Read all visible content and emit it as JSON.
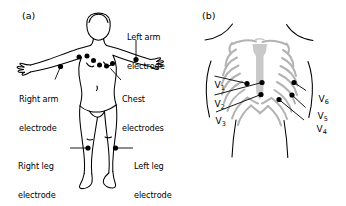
{
  "figure": {
    "caption_panels": [
      "(a)",
      "(b)"
    ],
    "background_color": "#ffffff",
    "ink_color": "#000000",
    "ribcage_color": "#b3b3b3",
    "sternum_color": "#c9c9c9",
    "electrode_color": "#000000"
  },
  "panel_a": {
    "tag": "(a)",
    "subject": "anterior-human-body-outline",
    "labels": {
      "right_arm_line1": "Right arm",
      "right_arm_line2": "electrode",
      "left_arm_line1": "Left arm",
      "left_arm_line2": "electrode",
      "chest_line1": "Chest",
      "chest_line2": "electrodes",
      "right_leg_line1": "Right leg",
      "right_leg_line2": "electrode",
      "left_leg_line1": "Left leg",
      "left_leg_line2": "electrode"
    },
    "electrodes": [
      {
        "name": "right-arm-electrode",
        "x": 60.5,
        "y": 66.5,
        "r": 2.6
      },
      {
        "name": "left-arm-electrode",
        "x": 136.0,
        "y": 59.5,
        "r": 2.6
      },
      {
        "name": "chest-electrode-v1",
        "x": 79.0,
        "y": 57.0,
        "r": 2.5
      },
      {
        "name": "chest-electrode-v2",
        "x": 87.0,
        "y": 56.0,
        "r": 2.5
      },
      {
        "name": "chest-electrode-v3",
        "x": 93.5,
        "y": 60.5,
        "r": 2.5
      },
      {
        "name": "chest-electrode-v4",
        "x": 99.5,
        "y": 65.0,
        "r": 2.5
      },
      {
        "name": "chest-electrode-v5",
        "x": 106.5,
        "y": 66.0,
        "r": 2.5
      },
      {
        "name": "chest-electrode-v6",
        "x": 112.5,
        "y": 63.5,
        "r": 2.5
      },
      {
        "name": "right-leg-electrode",
        "x": 88.0,
        "y": 148.0,
        "r": 2.6
      },
      {
        "name": "left-leg-electrode",
        "x": 115.5,
        "y": 148.0,
        "r": 2.6
      }
    ]
  },
  "panel_b": {
    "tag": "(b)",
    "subject": "anterior-thorax-ribcage",
    "lead_labels": [
      {
        "name": "V1",
        "base": "V",
        "sub": "1"
      },
      {
        "name": "V2",
        "base": "V",
        "sub": "2"
      },
      {
        "name": "V3",
        "base": "V",
        "sub": "3"
      },
      {
        "name": "V4",
        "base": "V",
        "sub": "4"
      },
      {
        "name": "V5",
        "base": "V",
        "sub": "5"
      },
      {
        "name": "V6",
        "base": "V",
        "sub": "6"
      }
    ],
    "electrodes": [
      {
        "name": "precordial-electrode-v1",
        "x": 247.0,
        "y": 83.5,
        "r": 2.6
      },
      {
        "name": "precordial-electrode-v2",
        "x": 262.0,
        "y": 82.5,
        "r": 2.6
      },
      {
        "name": "precordial-electrode-v3",
        "x": 261.0,
        "y": 94.5,
        "r": 2.6
      },
      {
        "name": "precordial-electrode-v4",
        "x": 279.0,
        "y": 99.5,
        "r": 2.6
      },
      {
        "name": "precordial-electrode-v5",
        "x": 292.0,
        "y": 95.0,
        "r": 2.6
      },
      {
        "name": "precordial-electrode-v6",
        "x": 294.0,
        "y": 82.5,
        "r": 2.6
      }
    ]
  }
}
